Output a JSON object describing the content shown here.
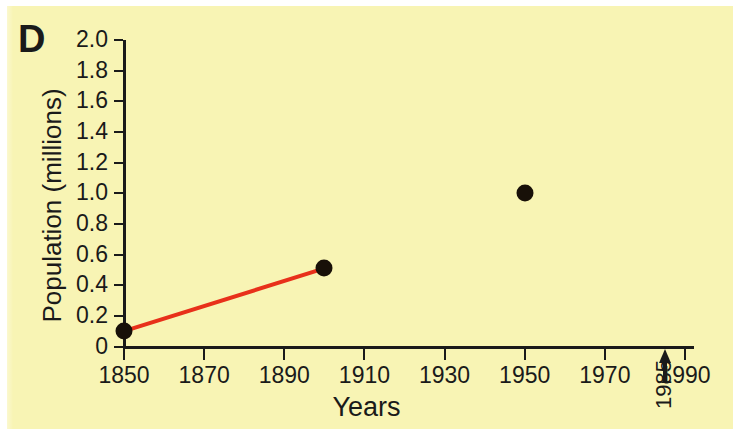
{
  "panel": {
    "letter": "D"
  },
  "colors": {
    "background": "#f8f4b4",
    "axis": "#1a1a1a",
    "marker": "#181008",
    "line": "#e8301a",
    "page": "#ffffff"
  },
  "chart_data": {
    "type": "line",
    "title": "",
    "subtitle": "",
    "xlabel": "Years",
    "ylabel": "Population (millions)",
    "xlim": [
      1850,
      1990
    ],
    "ylim": [
      0,
      2.0
    ],
    "xticks": [
      1850,
      1870,
      1890,
      1910,
      1930,
      1950,
      1970,
      1990
    ],
    "xticklabels": [
      "1850",
      "1870",
      "1890",
      "1910",
      "1930",
      "1950",
      "1970",
      "1990"
    ],
    "yticks": [
      0,
      0.2,
      0.4,
      0.6,
      0.8,
      1.0,
      1.2,
      1.4,
      1.6,
      1.8,
      2.0
    ],
    "yticklabels": [
      "0",
      "0.2",
      "0.4",
      "0.6",
      "0.8",
      "1.0",
      "1.2",
      "1.4",
      "1.6",
      "1.8",
      "2.0"
    ],
    "grid": false,
    "legend": false,
    "series": [
      {
        "name": "Population",
        "marker": "filled-circle",
        "x": [
          1850,
          1900,
          1950
        ],
        "y": [
          0.1,
          0.51,
          1.0
        ]
      }
    ],
    "connected_segments": [
      {
        "from": {
          "x": 1850,
          "y": 0.1
        },
        "to": {
          "x": 1900,
          "y": 0.51
        },
        "color": "#e8301a"
      }
    ],
    "annotations": [
      {
        "name": "year-marker",
        "text": "1985",
        "x": 1985,
        "orientation": "vertical",
        "arrow": "up",
        "arrow_target": "x-axis"
      }
    ]
  }
}
